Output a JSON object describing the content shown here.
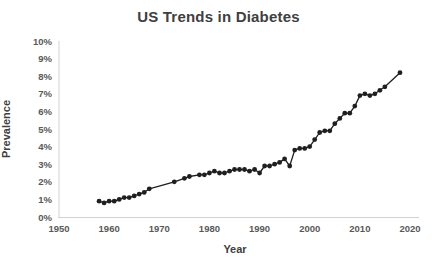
{
  "page": {
    "background_color": "#ffffff"
  },
  "chart_data": {
    "type": "line",
    "title": "US Trends in Diabetes",
    "xlabel": "Year",
    "ylabel": "Prevalence",
    "xlim": [
      1950,
      2020
    ],
    "ylim": [
      0,
      10
    ],
    "grid": false,
    "legend": "none",
    "x_ticks": [
      {
        "value": 1950,
        "label": "1950"
      },
      {
        "value": 1960,
        "label": "1960"
      },
      {
        "value": 1970,
        "label": "1970"
      },
      {
        "value": 1980,
        "label": "1980"
      },
      {
        "value": 1990,
        "label": "1990"
      },
      {
        "value": 2000,
        "label": "2000"
      },
      {
        "value": 2010,
        "label": "2010"
      },
      {
        "value": 2020,
        "label": "2020"
      }
    ],
    "y_ticks": [
      {
        "value": 0,
        "label": "0%"
      },
      {
        "value": 1,
        "label": "1%"
      },
      {
        "value": 2,
        "label": "2%"
      },
      {
        "value": 3,
        "label": "3%"
      },
      {
        "value": 4,
        "label": "4%"
      },
      {
        "value": 5,
        "label": "5%"
      },
      {
        "value": 6,
        "label": "6%"
      },
      {
        "value": 7,
        "label": "7%"
      },
      {
        "value": 8,
        "label": "8%"
      },
      {
        "value": 9,
        "label": "9%"
      },
      {
        "value": 10,
        "label": "10%"
      }
    ],
    "colors": {
      "line": "#1f1f1f",
      "marker": "#1f1f1f",
      "axis_line": "#d2d2d2",
      "tick_text": "#595959",
      "title_text": "#404040"
    },
    "marker_style": "filled-circle",
    "series": [
      {
        "name": "Diagnosed diabetes prevalence (% of US population)",
        "points": [
          [
            1958,
            0.9
          ],
          [
            1959,
            0.8
          ],
          [
            1960,
            0.9
          ],
          [
            1961,
            0.9
          ],
          [
            1962,
            1.0
          ],
          [
            1963,
            1.1
          ],
          [
            1964,
            1.1
          ],
          [
            1965,
            1.2
          ],
          [
            1966,
            1.3
          ],
          [
            1967,
            1.4
          ],
          [
            1968,
            1.6
          ],
          [
            1973,
            2.0
          ],
          [
            1975,
            2.2
          ],
          [
            1976,
            2.3
          ],
          [
            1978,
            2.4
          ],
          [
            1979,
            2.4
          ],
          [
            1980,
            2.5
          ],
          [
            1981,
            2.6
          ],
          [
            1982,
            2.5
          ],
          [
            1983,
            2.5
          ],
          [
            1984,
            2.6
          ],
          [
            1985,
            2.7
          ],
          [
            1986,
            2.7
          ],
          [
            1987,
            2.7
          ],
          [
            1988,
            2.6
          ],
          [
            1989,
            2.7
          ],
          [
            1990,
            2.5
          ],
          [
            1991,
            2.9
          ],
          [
            1992,
            2.9
          ],
          [
            1993,
            3.0
          ],
          [
            1994,
            3.1
          ],
          [
            1995,
            3.3
          ],
          [
            1996,
            2.9
          ],
          [
            1997,
            3.8
          ],
          [
            1998,
            3.9
          ],
          [
            1999,
            3.9
          ],
          [
            2000,
            4.0
          ],
          [
            2001,
            4.4
          ],
          [
            2002,
            4.8
          ],
          [
            2003,
            4.9
          ],
          [
            2004,
            4.9
          ],
          [
            2005,
            5.3
          ],
          [
            2006,
            5.6
          ],
          [
            2007,
            5.9
          ],
          [
            2008,
            5.9
          ],
          [
            2009,
            6.3
          ],
          [
            2010,
            6.9
          ],
          [
            2011,
            7.0
          ],
          [
            2012,
            6.9
          ],
          [
            2013,
            7.0
          ],
          [
            2014,
            7.2
          ],
          [
            2015,
            7.4
          ],
          [
            2018,
            8.2
          ]
        ]
      }
    ]
  }
}
